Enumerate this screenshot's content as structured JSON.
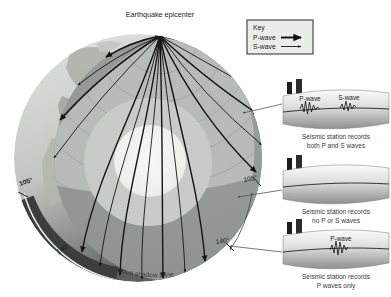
{
  "figure": {
    "epicenter_label": "Earthquake epicenter",
    "shadow_zone_label": "S-wave shadow zone",
    "angles": {
      "left_105": "105°",
      "left_140": "140°",
      "right_105": "105°",
      "right_140": "140°"
    }
  },
  "key": {
    "title": "Key",
    "p_wave": "P-wave",
    "s_wave": "S-wave"
  },
  "stations": [
    {
      "wave_labels": [
        "P-wave",
        "S-wave"
      ],
      "caption": [
        "Seismic station records",
        "both P and S waves"
      ]
    },
    {
      "wave_labels": [],
      "caption": [
        "Seismic station records",
        "no P or S waves"
      ]
    },
    {
      "wave_labels": [
        "P-wave"
      ],
      "caption": [
        "Seismic station records",
        "P waves only"
      ]
    }
  ],
  "colors": {
    "mantle": "#8e9390",
    "fan": "#b7bbba",
    "outer_core": "#c8cbc8",
    "inner_core": "#f2f4f0",
    "surface": "#d6d9d6",
    "shadow_band": "#3b3e3c",
    "background": "#ffffff"
  }
}
